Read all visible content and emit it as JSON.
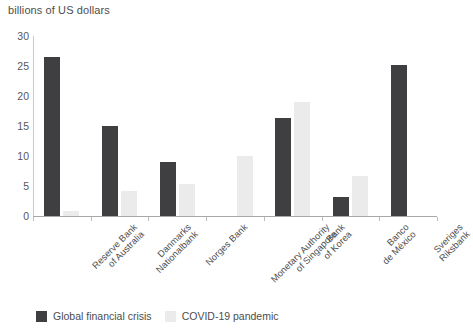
{
  "chart_data": {
    "type": "bar",
    "title": "billions of US dollars",
    "xlabel": "",
    "ylabel": "",
    "ylim": [
      0,
      30
    ],
    "yticks": [
      0,
      5,
      10,
      15,
      20,
      25,
      30
    ],
    "ytick_labels": [
      "0",
      "5",
      "10",
      "15",
      "20",
      "25",
      "30"
    ],
    "grid": false,
    "legend_position": "bottom-left",
    "categories": [
      "Reserve Bank\nof Australia",
      "Danmarks\nNationalbank",
      "Norges Bank",
      "Monetary Authority\nof Singapore",
      "Bank\nof Korea",
      "Banco\nde México",
      "Sveriges\nRiksbank"
    ],
    "series": [
      {
        "name": "Global financial crisis",
        "color": "#3f3f41",
        "values": [
          26.5,
          15.0,
          9.0,
          0,
          16.3,
          3.2,
          25.2
        ]
      },
      {
        "name": "COVID-19 pandemic",
        "color": "#ebebeb",
        "values": [
          0.8,
          4.2,
          5.3,
          10.0,
          19.0,
          6.7,
          0
        ]
      }
    ]
  },
  "legend": {
    "items": [
      {
        "label": "Global financial crisis",
        "swatch": "gfc"
      },
      {
        "label": "COVID-19 pandemic",
        "swatch": "covid"
      }
    ]
  }
}
